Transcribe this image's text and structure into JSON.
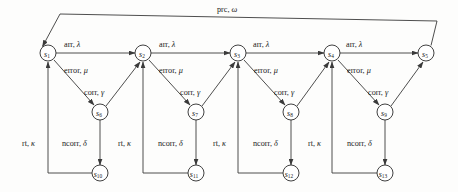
{
  "diagram": {
    "type": "state-transition-diagram",
    "title": "",
    "width": 458,
    "height": 192,
    "colors": {
      "background": "#fdfdfc",
      "stroke": "#3a3a3a",
      "node_fill": "#ffffff",
      "text": "#1a1a1a"
    },
    "nodes": [
      {
        "id": "s1",
        "name": "s",
        "sub": "1",
        "cx": 48,
        "cy": 53,
        "r": 8
      },
      {
        "id": "s2",
        "name": "s",
        "sub": "2",
        "cx": 143,
        "cy": 53,
        "r": 8
      },
      {
        "id": "s3",
        "name": "s",
        "sub": "3",
        "cx": 238,
        "cy": 53,
        "r": 8
      },
      {
        "id": "s4",
        "name": "s",
        "sub": "4",
        "cx": 332,
        "cy": 53,
        "r": 8
      },
      {
        "id": "s5",
        "name": "s",
        "sub": "5",
        "cx": 426,
        "cy": 53,
        "r": 8
      },
      {
        "id": "s6",
        "name": "s",
        "sub": "6",
        "cx": 100,
        "cy": 112,
        "r": 8
      },
      {
        "id": "s7",
        "name": "s",
        "sub": "7",
        "cx": 196,
        "cy": 112,
        "r": 8
      },
      {
        "id": "s8",
        "name": "s",
        "sub": "8",
        "cx": 291,
        "cy": 112,
        "r": 8
      },
      {
        "id": "s9",
        "name": "s",
        "sub": "9",
        "cx": 385,
        "cy": 112,
        "r": 8
      },
      {
        "id": "s10",
        "name": "s",
        "sub": "10",
        "cx": 100,
        "cy": 173,
        "r": 8
      },
      {
        "id": "s11",
        "name": "s",
        "sub": "11",
        "cx": 196,
        "cy": 173,
        "r": 8
      },
      {
        "id": "s12",
        "name": "s",
        "sub": "12",
        "cx": 291,
        "cy": 173,
        "r": 8
      },
      {
        "id": "s13",
        "name": "s",
        "sub": "13",
        "cx": 385,
        "cy": 173,
        "r": 8
      }
    ],
    "edge_labels": [
      {
        "id": "arr1",
        "head": "arr",
        "greek": "λ",
        "x": 64,
        "y": 47
      },
      {
        "id": "arr2",
        "head": "arr",
        "greek": "λ",
        "x": 159,
        "y": 47
      },
      {
        "id": "arr3",
        "head": "arr",
        "greek": "λ",
        "x": 253,
        "y": 47
      },
      {
        "id": "arr4",
        "head": "arr",
        "greek": "λ",
        "x": 346,
        "y": 47
      },
      {
        "id": "err1",
        "head": "error",
        "greek": "μ",
        "x": 64,
        "y": 71
      },
      {
        "id": "err2",
        "head": "error",
        "greek": "μ",
        "x": 159,
        "y": 71
      },
      {
        "id": "err3",
        "head": "error",
        "greek": "μ",
        "x": 254,
        "y": 71
      },
      {
        "id": "err4",
        "head": "error",
        "greek": "μ",
        "x": 347,
        "y": 71
      },
      {
        "id": "corr1",
        "head": "corr",
        "greek": "γ",
        "x": 84,
        "y": 92
      },
      {
        "id": "corr2",
        "head": "corr",
        "greek": "γ",
        "x": 180,
        "y": 92
      },
      {
        "id": "corr3",
        "head": "corr",
        "greek": "γ",
        "x": 274,
        "y": 92
      },
      {
        "id": "corr4",
        "head": "corr",
        "greek": "γ",
        "x": 368,
        "y": 92
      },
      {
        "id": "ncorr1",
        "head": "ncorr",
        "greek": "δ",
        "x": 62,
        "y": 143
      },
      {
        "id": "ncorr2",
        "head": "ncorr",
        "greek": "δ",
        "x": 158,
        "y": 143
      },
      {
        "id": "ncorr3",
        "head": "ncorr",
        "greek": "δ",
        "x": 253,
        "y": 143
      },
      {
        "id": "ncorr4",
        "head": "ncorr",
        "greek": "δ",
        "x": 347,
        "y": 143
      },
      {
        "id": "rt0",
        "head": "rt",
        "greek": "κ",
        "x": 22,
        "y": 143
      },
      {
        "id": "rt1",
        "head": "rt",
        "greek": "κ",
        "x": 118,
        "y": 143
      },
      {
        "id": "rt2",
        "head": "rt",
        "greek": "κ",
        "x": 213,
        "y": 143
      },
      {
        "id": "rt3",
        "head": "rt",
        "greek": "κ",
        "x": 308,
        "y": 143
      },
      {
        "id": "prc",
        "head": "prc",
        "greek": "ω",
        "x": 217,
        "y": 10
      }
    ],
    "transitions": [
      {
        "from": "s1",
        "to": "s2",
        "label": "arr, λ"
      },
      {
        "from": "s2",
        "to": "s3",
        "label": "arr, λ"
      },
      {
        "from": "s3",
        "to": "s4",
        "label": "arr, λ"
      },
      {
        "from": "s4",
        "to": "s5",
        "label": "arr, λ"
      },
      {
        "from": "s1",
        "to": "s6",
        "label": "error, μ"
      },
      {
        "from": "s2",
        "to": "s7",
        "label": "error, μ"
      },
      {
        "from": "s3",
        "to": "s8",
        "label": "error, μ"
      },
      {
        "from": "s4",
        "to": "s9",
        "label": "error, μ"
      },
      {
        "from": "s6",
        "to": "s2",
        "label": "corr, γ"
      },
      {
        "from": "s7",
        "to": "s3",
        "label": "corr, γ"
      },
      {
        "from": "s8",
        "to": "s4",
        "label": "corr, γ"
      },
      {
        "from": "s9",
        "to": "s5",
        "label": "corr, γ"
      },
      {
        "from": "s6",
        "to": "s10",
        "label": "ncorr, δ"
      },
      {
        "from": "s7",
        "to": "s11",
        "label": "ncorr, δ"
      },
      {
        "from": "s8",
        "to": "s12",
        "label": "ncorr, δ"
      },
      {
        "from": "s9",
        "to": "s13",
        "label": "ncorr, δ"
      },
      {
        "from": "s10",
        "to": "s1",
        "label": "rt, κ"
      },
      {
        "from": "s11",
        "to": "s2",
        "label": "rt, κ"
      },
      {
        "from": "s12",
        "to": "s3",
        "label": "rt, κ"
      },
      {
        "from": "s13",
        "to": "s4",
        "label": "rt, κ"
      },
      {
        "from": "s5",
        "to": "s1",
        "label": "prc, ω"
      }
    ]
  }
}
